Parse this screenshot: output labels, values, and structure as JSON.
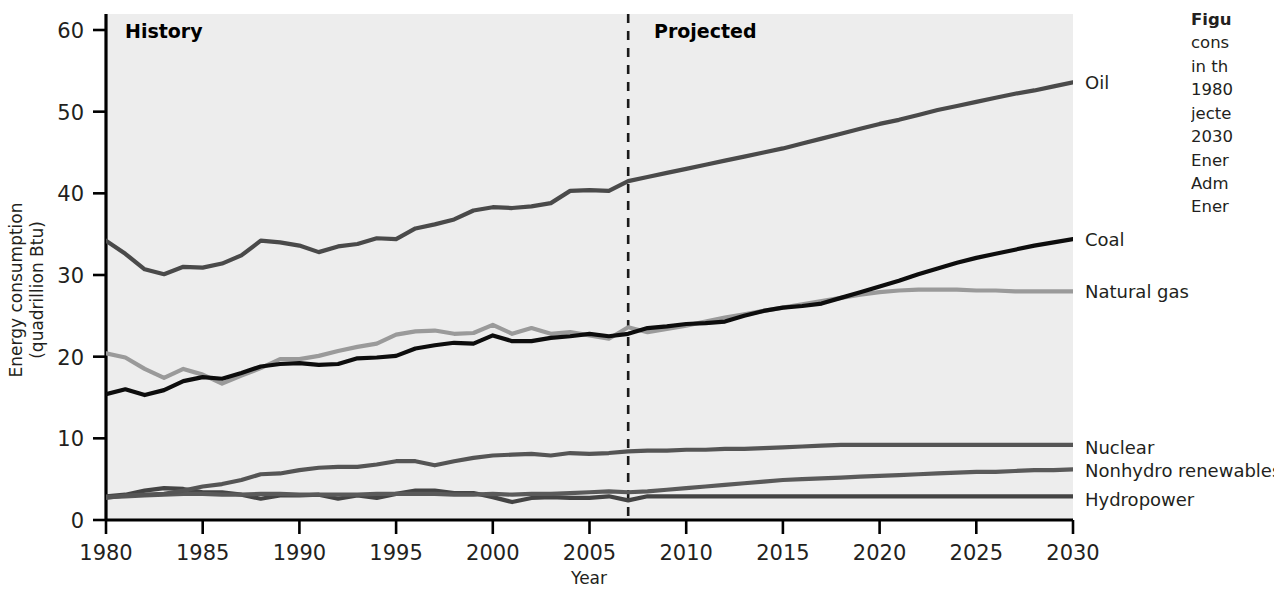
{
  "figure": {
    "era_history": "History",
    "era_projected": "Projected",
    "caption_lines": [
      "Figu",
      "cons",
      "in th",
      "1980",
      "jecte",
      "2030",
      "Ener",
      "Adm",
      "Ener"
    ]
  },
  "axes": {
    "ylabel_line1": "Energy consumption",
    "ylabel_line2": "(quadrillion Btu)",
    "xlabel": "Year",
    "yticks": [
      0,
      10,
      20,
      30,
      40,
      50,
      60
    ],
    "xticks": [
      1980,
      1985,
      1990,
      1995,
      2000,
      2005,
      2010,
      2015,
      2020,
      2025,
      2030
    ]
  },
  "colors": {
    "oil": "#4a4a4a",
    "coal": "#0d0d0d",
    "natural_gas": "#9a9a9a",
    "nuclear": "#555555",
    "nonhydro": "#5a5a5a",
    "hydropower": "#444444",
    "plot_bg": "#ededed",
    "divider": "#1a1a1a"
  },
  "chart_data": {
    "type": "line",
    "title": "",
    "xlabel": "Year",
    "ylabel": "Energy consumption (quadrillion Btu)",
    "xlim": [
      1980,
      2030
    ],
    "ylim": [
      0,
      60
    ],
    "grid": false,
    "legend": "right-inline labels at line ends",
    "history_range": [
      1980,
      2007
    ],
    "projection_range": [
      2007,
      2030
    ],
    "divider_year": 2007,
    "x": [
      1980,
      1981,
      1982,
      1983,
      1984,
      1985,
      1986,
      1987,
      1988,
      1989,
      1990,
      1991,
      1992,
      1993,
      1994,
      1995,
      1996,
      1997,
      1998,
      1999,
      2000,
      2001,
      2002,
      2003,
      2004,
      2005,
      2006,
      2007,
      2008,
      2009,
      2010,
      2011,
      2012,
      2013,
      2014,
      2015,
      2016,
      2017,
      2018,
      2019,
      2020,
      2021,
      2022,
      2023,
      2024,
      2025,
      2026,
      2027,
      2028,
      2029,
      2030
    ],
    "series": [
      {
        "name": "Oil",
        "label": "Oil",
        "color": "#4a4a4a",
        "values": [
          34.2,
          32.6,
          30.7,
          30.1,
          31.0,
          30.9,
          31.4,
          32.4,
          34.2,
          34.0,
          33.6,
          32.8,
          33.5,
          33.8,
          34.5,
          34.4,
          35.7,
          36.2,
          36.8,
          37.9,
          38.3,
          38.2,
          38.4,
          38.8,
          40.3,
          40.4,
          40.3,
          41.5,
          42.0,
          42.5,
          43.0,
          43.5,
          44.0,
          44.5,
          45.0,
          45.5,
          46.1,
          46.7,
          47.3,
          47.9,
          48.5,
          49.0,
          49.6,
          50.2,
          50.7,
          51.2,
          51.7,
          52.2,
          52.6,
          53.1,
          53.6
        ]
      },
      {
        "name": "Natural gas",
        "label": "Natural gas",
        "color": "#9a9a9a",
        "values": [
          20.4,
          19.9,
          18.5,
          17.4,
          18.5,
          17.8,
          16.7,
          17.7,
          18.6,
          19.7,
          19.7,
          20.1,
          20.7,
          21.2,
          21.6,
          22.7,
          23.1,
          23.2,
          22.8,
          22.9,
          23.9,
          22.8,
          23.5,
          22.8,
          23.0,
          22.6,
          22.2,
          23.6,
          23.0,
          23.4,
          23.8,
          24.3,
          24.8,
          25.2,
          25.6,
          26.0,
          26.4,
          26.8,
          27.2,
          27.6,
          27.9,
          28.1,
          28.2,
          28.2,
          28.2,
          28.1,
          28.1,
          28.0,
          28.0,
          28.0,
          28.0
        ]
      },
      {
        "name": "Coal",
        "label": "Coal",
        "color": "#0d0d0d",
        "values": [
          15.4,
          16.0,
          15.3,
          15.9,
          17.0,
          17.5,
          17.3,
          18.0,
          18.8,
          19.1,
          19.2,
          19.0,
          19.1,
          19.8,
          19.9,
          20.1,
          21.0,
          21.4,
          21.7,
          21.6,
          22.6,
          21.9,
          21.9,
          22.3,
          22.5,
          22.8,
          22.5,
          22.8,
          23.5,
          23.7,
          24.0,
          24.1,
          24.3,
          25.0,
          25.6,
          26.0,
          26.2,
          26.5,
          27.2,
          27.9,
          28.6,
          29.3,
          30.1,
          30.8,
          31.5,
          32.1,
          32.6,
          33.1,
          33.6,
          34.0,
          34.4
        ]
      },
      {
        "name": "Nuclear",
        "label": "Nuclear",
        "color": "#555555",
        "values": [
          2.7,
          3.0,
          3.1,
          3.2,
          3.6,
          4.1,
          4.4,
          4.9,
          5.6,
          5.7,
          6.1,
          6.4,
          6.5,
          6.5,
          6.8,
          7.2,
          7.2,
          6.7,
          7.2,
          7.6,
          7.9,
          8.0,
          8.1,
          7.9,
          8.2,
          8.1,
          8.2,
          8.4,
          8.5,
          8.5,
          8.6,
          8.6,
          8.7,
          8.7,
          8.8,
          8.9,
          9.0,
          9.1,
          9.2,
          9.2,
          9.2,
          9.2,
          9.2,
          9.2,
          9.2,
          9.2,
          9.2,
          9.2,
          9.2,
          9.2,
          9.2
        ]
      },
      {
        "name": "Hydropower",
        "label": "Hydropower",
        "color": "#444444",
        "values": [
          2.9,
          3.1,
          3.6,
          3.9,
          3.8,
          3.4,
          3.4,
          3.1,
          2.6,
          3.0,
          3.0,
          3.1,
          2.6,
          3.0,
          2.7,
          3.2,
          3.6,
          3.6,
          3.3,
          3.3,
          2.8,
          2.2,
          2.7,
          2.8,
          2.7,
          2.7,
          2.9,
          2.4,
          2.9,
          2.9,
          2.9,
          2.9,
          2.9,
          2.9,
          2.9,
          2.9,
          2.9,
          2.9,
          2.9,
          2.9,
          2.9,
          2.9,
          2.9,
          2.9,
          2.9,
          2.9,
          2.9,
          2.9,
          2.9,
          2.9,
          2.9
        ]
      },
      {
        "name": "Nonhydro renewables",
        "label": "Nonhydro renewables",
        "color": "#5a5a5a",
        "values": [
          2.8,
          2.9,
          3.0,
          3.1,
          3.2,
          3.2,
          3.1,
          3.1,
          3.2,
          3.2,
          3.1,
          3.1,
          3.1,
          3.1,
          3.2,
          3.2,
          3.2,
          3.2,
          3.1,
          3.1,
          3.2,
          3.1,
          3.2,
          3.2,
          3.3,
          3.4,
          3.5,
          3.4,
          3.5,
          3.7,
          3.9,
          4.1,
          4.3,
          4.5,
          4.7,
          4.9,
          5.0,
          5.1,
          5.2,
          5.3,
          5.4,
          5.5,
          5.6,
          5.7,
          5.8,
          5.9,
          5.9,
          6.0,
          6.1,
          6.1,
          6.2
        ]
      }
    ]
  }
}
